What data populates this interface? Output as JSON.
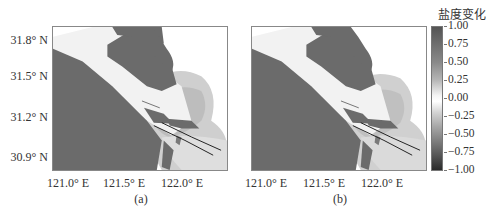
{
  "figure": {
    "colorbar": {
      "title": "盐度变化",
      "ticks": [
        "1.00",
        "0.75",
        "0.50",
        "0.25",
        "0.00",
        "−0.25",
        "−0.50",
        "−0.75",
        "−1.00"
      ],
      "range": [
        -1.0,
        1.0
      ]
    },
    "y_axis": {
      "ticks": [
        "31.8° N",
        "31.5° N",
        "31.2° N",
        "30.9° N"
      ]
    },
    "x_axis": {
      "ticks": [
        "121.0° E",
        "121.5° E",
        "122.0° E"
      ]
    },
    "panels": [
      {
        "id": "a",
        "caption": "(a)"
      },
      {
        "id": "b",
        "caption": "(b)"
      }
    ],
    "colors": {
      "land": "#6b6b6b",
      "river": "#f0f0f0",
      "plume_light": "#d4d4d4",
      "plume_mid": "#bdbdbd",
      "jetty_line": "#222222"
    }
  }
}
